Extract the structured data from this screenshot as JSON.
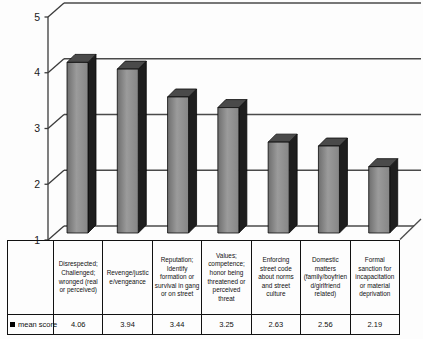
{
  "chart_data": {
    "type": "bar",
    "style": "3d-column",
    "title": "",
    "xlabel": "",
    "ylabel": "",
    "ylim": [
      1,
      5
    ],
    "yticks": [
      5,
      4,
      3,
      2,
      1
    ],
    "ytick_labels": [
      "5",
      "4",
      "3",
      "2",
      "1"
    ],
    "grid": true,
    "legend_position": "bottom-table",
    "bar_color_front": "#8c8c8c",
    "bar_color_side": "#1e1e1e",
    "bar_color_top": "#4a4a4a",
    "categories": [
      "Disrespected; Challenged; wronged (real or perceived)",
      "Revenge/justice/vengeance",
      "Reputation; Identify formation or survival in gang or on street",
      "Values; competence; honor being threatened or perceived threat",
      "Enforcing street code about norms and street culture",
      "Domestic matters (family/boyfriend/girlfriend related)",
      "Formal sanction for incapacitation or material deprivation"
    ],
    "series": [
      {
        "name": "mean score",
        "values": [
          4.06,
          3.94,
          3.44,
          3.25,
          2.63,
          2.56,
          2.19
        ]
      }
    ],
    "value_labels": [
      "4.06",
      "3.94",
      "3.44",
      "3.25",
      "2.63",
      "2.56",
      "2.19"
    ],
    "legend_label": "mean score"
  }
}
